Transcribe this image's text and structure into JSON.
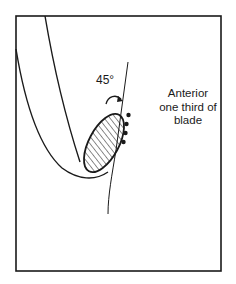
{
  "diagram": {
    "angle_label": "45°",
    "annotation_lines": [
      "Anterior",
      "one third of",
      "blade"
    ],
    "colors": {
      "stroke": "#1a1a1a",
      "background": "#ffffff"
    },
    "elements": {
      "frame": "rectangular border",
      "curved_band": "U-shaped curved structure",
      "hatched_region": "diagonally hatched ellipse",
      "line": "straight reference line (blade)",
      "dots": 4,
      "arc_arrow": "curved arrow indicating 45° rotation"
    }
  }
}
